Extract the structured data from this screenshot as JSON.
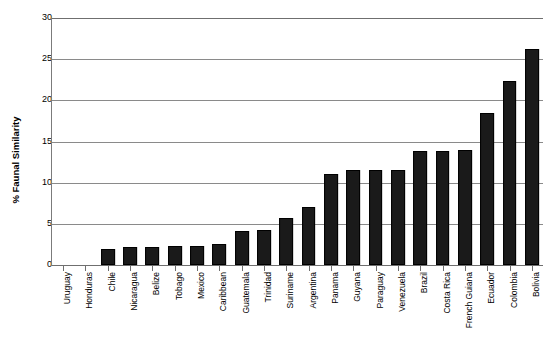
{
  "chart_data": {
    "type": "bar",
    "title": "",
    "xlabel": "",
    "ylabel": "% Faunal Similarity",
    "ylim": [
      0,
      30
    ],
    "yticks": [
      0,
      5,
      10,
      15,
      20,
      25,
      30
    ],
    "grid": true,
    "legend": "none",
    "bar_color": "#1a1a1a",
    "categories": [
      "Uruguay",
      "Honduras",
      "Chile",
      "Nicaragua",
      "Belize",
      "Tobago",
      "Mexico",
      "Caribbean",
      "Guatemala",
      "Trinidad",
      "Suriname",
      "Argentina",
      "Panama",
      "Guyana",
      "Paraguay",
      "Venezuela",
      "Brazil",
      "Costa Rica",
      "French Guiana",
      "Ecuador",
      "Colombia",
      "Bolivia"
    ],
    "values": [
      0,
      0,
      2.0,
      2.2,
      2.2,
      2.3,
      2.3,
      2.5,
      4.1,
      4.2,
      5.7,
      7.1,
      11.1,
      11.5,
      11.5,
      11.6,
      13.8,
      13.9,
      14.0,
      18.5,
      22.3,
      26.2
    ]
  }
}
